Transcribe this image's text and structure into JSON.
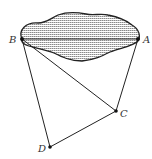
{
  "diagram": {
    "points": {
      "A": {
        "label": "A",
        "x": 138,
        "y": 39
      },
      "B": {
        "label": "B",
        "x": 22,
        "y": 39
      },
      "C": {
        "label": "C",
        "x": 116,
        "y": 111
      },
      "D": {
        "label": "D",
        "x": 50,
        "y": 147
      }
    },
    "segments": [
      "AB",
      "BD",
      "DC",
      "BC",
      "CA"
    ],
    "region": {
      "name": "shaded-region",
      "fill": "hatched-horizontal",
      "stroke": "#222222"
    },
    "colors": {
      "stroke": "#222222",
      "hatch": "#7a7a7a",
      "label": "#333333"
    }
  }
}
